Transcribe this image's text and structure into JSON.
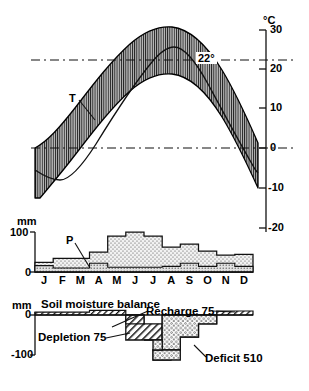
{
  "figure": {
    "title_soil": "Soil moisture balance",
    "axis_unit_temp": "°C",
    "axis_unit_precip": "mm",
    "axis_unit_soil": "mm"
  },
  "months": [
    "J",
    "F",
    "M",
    "A",
    "M",
    "J",
    "J",
    "A",
    "S",
    "O",
    "N",
    "D"
  ],
  "labels": {
    "temperature_series": "T",
    "precipitation_series": "P",
    "recharge": "Recharge 75",
    "depletion": "Depletion 75",
    "deficit": "Deficit 510",
    "isotherm": "22°"
  },
  "colors": {
    "ink": "#000000",
    "band_fill": "#b4b4b4",
    "stipple_fill": "#efefef",
    "hatch_fill": "#ffffff",
    "dash": "#000000"
  },
  "chart_data": [
    {
      "type": "area",
      "title": "Monthly temperature range",
      "ylabel": "°C",
      "xlabel": "",
      "categories": [
        "J",
        "F",
        "M",
        "A",
        "M",
        "J",
        "J",
        "A",
        "S",
        "O",
        "N",
        "D"
      ],
      "ylim": [
        -20,
        30
      ],
      "yticks": [
        30,
        20,
        10,
        0,
        -10,
        -20
      ],
      "grid": false,
      "annotations": [
        {
          "text": "22°",
          "type": "dashed-line",
          "y": 22
        },
        {
          "text": "0",
          "type": "dashed-line",
          "y": 0
        },
        {
          "text": "T",
          "type": "series-callout"
        }
      ],
      "series": [
        {
          "name": "Maximum temperature",
          "values": [
            0,
            2,
            9,
            17,
            23,
            27,
            28,
            27,
            22,
            15,
            7,
            1
          ]
        },
        {
          "name": "Mean temperature",
          "values": [
            -5,
            -3,
            4,
            12,
            19,
            24,
            25,
            24,
            18,
            11,
            3,
            -4
          ]
        },
        {
          "name": "Minimum temperature",
          "values": [
            -9,
            -8,
            -1,
            7,
            15,
            21,
            23,
            21,
            14,
            6,
            -2,
            -9
          ]
        }
      ]
    },
    {
      "type": "bar",
      "title": "Precipitation and potential evapotranspiration",
      "ylabel": "mm",
      "xlabel": "",
      "categories": [
        "J",
        "F",
        "M",
        "A",
        "M",
        "J",
        "J",
        "A",
        "S",
        "O",
        "N",
        "D"
      ],
      "ylim": [
        0,
        100
      ],
      "yticks": [
        0,
        100
      ],
      "grid": false,
      "series": [
        {
          "name": "P",
          "values": [
            24,
            34,
            34,
            50,
            90,
            100,
            90,
            62,
            70,
            52,
            42,
            44
          ]
        },
        {
          "name": "Potential evapotranspiration",
          "values": [
            6,
            6,
            6,
            22,
            12,
            12,
            12,
            14,
            20,
            14,
            22,
            12
          ]
        }
      ]
    },
    {
      "type": "area",
      "title": "Soil moisture balance",
      "ylabel": "mm",
      "xlabel": "",
      "categories": [
        "J",
        "F",
        "M",
        "A",
        "M",
        "J",
        "J",
        "A",
        "S",
        "O",
        "N",
        "D"
      ],
      "ylim": [
        -120,
        10
      ],
      "yticks": [
        0,
        -100
      ],
      "grid": false,
      "annotations": [
        {
          "text": "Recharge 75",
          "type": "callout"
        },
        {
          "text": "Depletion 75",
          "type": "callout"
        },
        {
          "text": "Deficit 510",
          "type": "callout"
        }
      ],
      "series": [
        {
          "name": "Recharge",
          "values": [
            6,
            6,
            6,
            5,
            0,
            0,
            0,
            0,
            0,
            0,
            6,
            6
          ]
        },
        {
          "name": "Depletion",
          "values": [
            0,
            0,
            0,
            -22,
            -62,
            0,
            0,
            0,
            0,
            0,
            0,
            0
          ]
        },
        {
          "name": "Deficit",
          "values": [
            0,
            0,
            0,
            0,
            -62,
            -88,
            -112,
            -112,
            -88,
            -22,
            0,
            0
          ]
        }
      ]
    }
  ]
}
